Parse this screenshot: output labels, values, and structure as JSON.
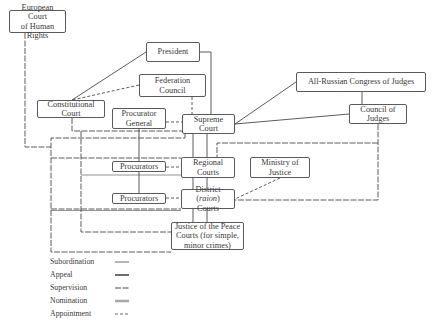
{
  "nodes": {
    "echr": {
      "line1": "European Court",
      "line2": "of Human Rights"
    },
    "president": {
      "label": "President"
    },
    "federation_council": {
      "label": "Federation Council"
    },
    "constitutional_court": {
      "label": "Constitutional Court"
    },
    "procurator_general": {
      "line1": "Procurator",
      "line2": "General"
    },
    "supreme_court": {
      "label": "Supreme Court"
    },
    "congress_of_judges": {
      "label": "All-Russian Congress of Judges"
    },
    "council_of_judges": {
      "label": "Council of Judges"
    },
    "procurators_regional": {
      "label": "Procurators"
    },
    "regional_courts": {
      "label": "Regional Courts"
    },
    "ministry_of_justice": {
      "label": "Ministry of Justice"
    },
    "procurators_district": {
      "label": "Procurators"
    },
    "district_courts": {
      "line1_a": "District (",
      "line1_i": "raion",
      "line1_b": ")",
      "line2": "Courts"
    },
    "justice_of_peace": {
      "line1": "Justice of the Peace",
      "line2": "Courts (for simple,",
      "line3": "minor crimes)"
    }
  },
  "legend": [
    {
      "label": "Subordination",
      "style": "solid-thin"
    },
    {
      "label": "Appeal",
      "style": "solid-thick"
    },
    {
      "label": "Supervision",
      "style": "dash-long"
    },
    {
      "label": "Nomination",
      "style": "solid-double"
    },
    {
      "label": "Appointment",
      "style": "dash-short"
    }
  ],
  "colors": {
    "line": "#4a4a4a",
    "border": "#5a5a5a",
    "text": "#3a3a3a"
  }
}
